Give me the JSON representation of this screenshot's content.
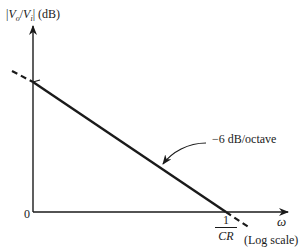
{
  "diagram": {
    "type": "bode-magnitude-asymptote",
    "y_axis": {
      "label": "|V_o/V_i| (dB)",
      "label_parts": {
        "open": "|",
        "vo": "V",
        "vo_sub": "o",
        "slash": "/",
        "vi": "V",
        "vi_sub": "i",
        "close": "|",
        "unit": " (dB)"
      }
    },
    "x_axis": {
      "label": "ω",
      "scale_note": "(Log scale)"
    },
    "origin_label": "0",
    "corner_tick": {
      "numerator": "1",
      "denominator": "CR"
    },
    "slope_annotation": "−6 dB/octave",
    "colors": {
      "line": "#1a1a1a",
      "background": "#ffffff"
    }
  }
}
